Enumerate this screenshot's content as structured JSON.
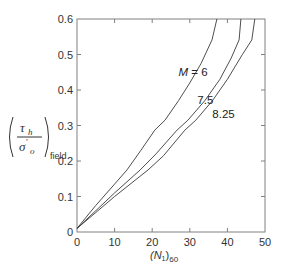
{
  "chart_data": {
    "type": "line",
    "title": "",
    "xlabel": "(N1)60",
    "ylabel": "(τh / σ'o)field",
    "xlim": [
      0,
      50
    ],
    "ylim": [
      0,
      0.6
    ],
    "xticks": [
      0,
      10,
      20,
      30,
      40,
      50
    ],
    "yticks": [
      0,
      0.1,
      0.2,
      0.3,
      0.4,
      0.5,
      0.6
    ],
    "xtick_labels": [
      "0",
      "10",
      "20",
      "30",
      "40",
      "50"
    ],
    "ytick_labels": [
      "0",
      "0.1",
      "0.2",
      "0.3",
      "0.4",
      "0.5",
      "0.6"
    ],
    "grid": false,
    "legend": "inline labels",
    "series": [
      {
        "name": "M = 6",
        "label_text": "M = 6",
        "x": [
          0,
          5,
          10,
          13.3,
          17,
          20.7,
          23.4,
          27,
          30,
          33,
          35.9,
          37.2
        ],
        "y": [
          0.01,
          0.075,
          0.135,
          0.175,
          0.23,
          0.287,
          0.315,
          0.37,
          0.42,
          0.475,
          0.541,
          0.6
        ]
      },
      {
        "name": "M = 7.5",
        "label_text": "7.5",
        "x": [
          0,
          5,
          10,
          16.8,
          21,
          26.6,
          29.5,
          34,
          38,
          41,
          43.1,
          43.6
        ],
        "y": [
          0.01,
          0.06,
          0.11,
          0.175,
          0.22,
          0.287,
          0.315,
          0.37,
          0.43,
          0.49,
          0.541,
          0.6
        ]
      },
      {
        "name": "M = 8.25",
        "label_text": "8.25",
        "x": [
          0,
          5,
          10,
          18.9,
          23,
          28.7,
          31.6,
          36,
          40,
          44,
          46.5,
          47.3
        ],
        "y": [
          0.01,
          0.055,
          0.1,
          0.175,
          0.215,
          0.287,
          0.315,
          0.37,
          0.43,
          0.5,
          0.541,
          0.6
        ]
      }
    ],
    "annotations": [
      {
        "text": "M = 6",
        "x": 27,
        "y": 0.44
      },
      {
        "text": "7.5",
        "x": 32,
        "y": 0.36
      },
      {
        "text": "8.25",
        "x": 36,
        "y": 0.32
      }
    ]
  },
  "axis": {
    "x_label_main": "(N",
    "x_label_sub1": "1",
    "x_label_close": ")",
    "x_label_sub2": "60",
    "y_label_num": "τ",
    "y_label_num_sub": "h",
    "y_label_den": "σ",
    "y_label_den_prime": "′",
    "y_label_den_sub": "o",
    "y_label_field": "field"
  },
  "colors": {
    "axis": "#808080",
    "curve": "#3a3a3a",
    "text": "#333333"
  }
}
